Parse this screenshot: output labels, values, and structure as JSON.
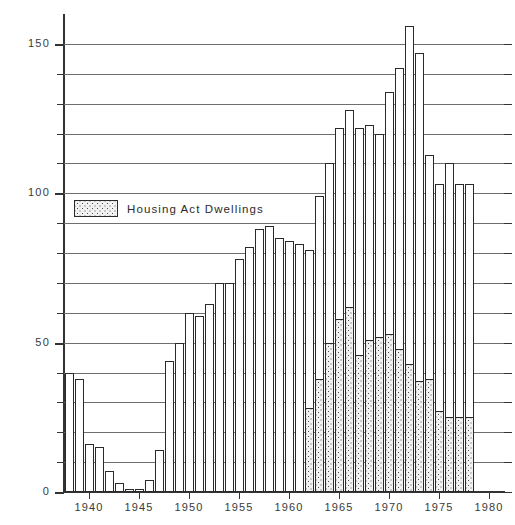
{
  "chart_data": {
    "type": "bar",
    "title": "",
    "xlabel": "",
    "ylabel": "Finished Dwellings (000s)",
    "ylim": [
      0,
      160
    ],
    "ytick_labels": [
      "0",
      "50",
      "100",
      "150"
    ],
    "ytick_values": [
      0,
      50,
      100,
      150
    ],
    "gridlines": [
      10,
      20,
      30,
      40,
      50,
      60,
      70,
      80,
      90,
      100,
      110,
      120,
      130,
      140,
      150
    ],
    "grid": true,
    "xtick_labels": [
      "1940",
      "1945",
      "1950",
      "1955",
      "1960",
      "1965",
      "1970",
      "1975",
      "1980"
    ],
    "xtick_values": [
      1940,
      1945,
      1950,
      1955,
      1960,
      1965,
      1970,
      1975,
      1980
    ],
    "xlim": [
      1937.5,
      1981.5
    ],
    "legend_position": "inside-upper-left",
    "categories": [
      1938,
      1939,
      1940,
      1941,
      1942,
      1943,
      1944,
      1945,
      1946,
      1947,
      1948,
      1949,
      1950,
      1951,
      1952,
      1953,
      1954,
      1955,
      1956,
      1957,
      1958,
      1959,
      1960,
      1961,
      1962,
      1963,
      1964,
      1965,
      1966,
      1967,
      1968,
      1969,
      1970,
      1971,
      1972,
      1973,
      1974,
      1975,
      1976,
      1977,
      1978,
      1979,
      1980,
      1981
    ],
    "series": [
      {
        "name": "Housing Act Dwellings",
        "fill": "dotted",
        "values": [
          0,
          0,
          0,
          0,
          0,
          0,
          0,
          0,
          0,
          0,
          0,
          0,
          0,
          0,
          0,
          0,
          0,
          0,
          0,
          0,
          0,
          0,
          0,
          0,
          28,
          38,
          50,
          58,
          62,
          46,
          51,
          52,
          53,
          48,
          43,
          37,
          38,
          27,
          25,
          25,
          25,
          0,
          0,
          0
        ]
      },
      {
        "name": "Total Finished Dwellings",
        "fill": "white",
        "values": [
          40,
          38,
          16,
          15,
          7,
          3,
          1,
          1,
          4,
          14,
          44,
          50,
          60,
          59,
          63,
          70,
          70,
          78,
          82,
          88,
          89,
          85,
          84,
          83,
          81,
          99,
          110,
          122,
          128,
          122,
          123,
          120,
          134,
          142,
          156,
          147,
          113,
          103,
          110,
          103,
          103,
          0,
          0,
          0
        ]
      }
    ],
    "bar_years_start": 1938,
    "bar_years_end": 1981,
    "legend_label": "Housing Act Dwellings"
  },
  "axis": {
    "y_title": "Finished Dwellings (000s)"
  }
}
